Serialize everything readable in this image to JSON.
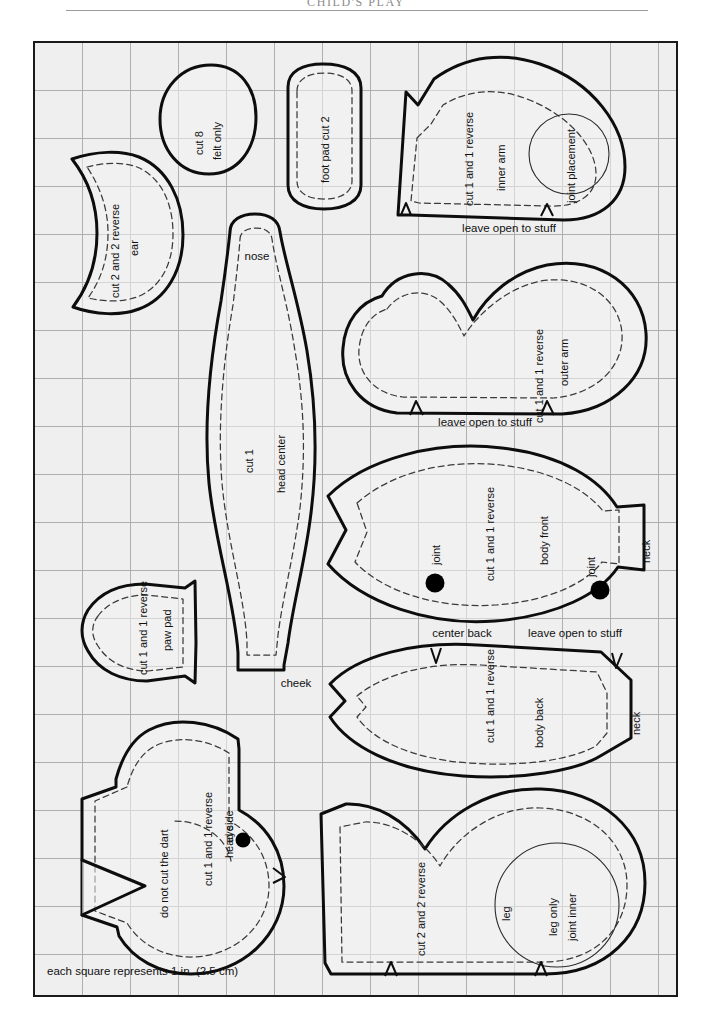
{
  "page": {
    "running_head": "CHILD'S PLAY",
    "scale_caption": "each square represents 1 in. (2.5 cm)"
  },
  "grid": {
    "cell_size_px": 48,
    "columns": 13,
    "rows": 20,
    "square_means": "1 in. (2.5 cm)",
    "sheet_fill": "#efefef",
    "line_color": "#9a9a9a",
    "border_color": "#1a1a1a"
  },
  "legend": {
    "cut_line_color": "#0d0d0d",
    "seam_line_color": "#3a3a3a",
    "marker_color": "#000000"
  },
  "pieces": [
    {
      "id": "felt-circle",
      "name": "felt circle",
      "labels": [
        "cut 8",
        "felt only"
      ],
      "has_seam_allowance": false
    },
    {
      "id": "foot-pad",
      "name": "foot pad",
      "labels": [
        "foot pad cut 2"
      ],
      "has_seam_allowance": true
    },
    {
      "id": "ear",
      "name": "ear",
      "labels": [
        "cut 2 and 2 reverse",
        "ear"
      ],
      "has_seam_allowance": true
    },
    {
      "id": "inner-arm",
      "name": "inner arm",
      "labels": [
        "cut 1 and 1 reverse",
        "inner arm",
        "joint placement"
      ],
      "notes": [
        "leave open to stuff"
      ],
      "has_seam_allowance": true,
      "has_joint_circle": true
    },
    {
      "id": "outer-arm",
      "name": "outer arm",
      "labels": [
        "cut 1 and 1 reverse",
        "outer arm"
      ],
      "notes": [
        "leave open to stuff"
      ],
      "has_seam_allowance": true
    },
    {
      "id": "head-center",
      "name": "head center",
      "labels": [
        "cut 1",
        "head center"
      ],
      "notes": [
        "nose",
        "cheek"
      ],
      "has_seam_allowance": true
    },
    {
      "id": "body-front",
      "name": "body front",
      "labels": [
        "cut 1 and 1 reverse",
        "body front",
        "neck",
        "joint",
        "joint"
      ],
      "has_seam_allowance": true,
      "joint_marks": 2
    },
    {
      "id": "paw-pad",
      "name": "paw pad",
      "labels": [
        "cut 1 and 1 reverse",
        "paw pad"
      ],
      "has_seam_allowance": true
    },
    {
      "id": "body-back",
      "name": "body back",
      "labels": [
        "cut 1 and 1 reverse",
        "body back",
        "neck"
      ],
      "notes": [
        "center back",
        "leave open to stuff"
      ],
      "has_seam_allowance": true
    },
    {
      "id": "head-side",
      "name": "head side",
      "labels": [
        "do not cut the dart",
        "cut 1 and 1 reverse",
        "head side",
        "eye"
      ],
      "has_seam_allowance": true,
      "has_dart": true,
      "joint_marks": 1
    },
    {
      "id": "leg",
      "name": "leg",
      "labels": [
        "cut 2 and 2 reverse",
        "leg",
        "leg only",
        "joint inner"
      ],
      "has_seam_allowance": true,
      "has_joint_circle": true
    }
  ],
  "text": {
    "cut8": "cut 8",
    "felt_only": "felt only",
    "foot_pad_cut2": "foot pad cut 2",
    "cut2_and_2_reverse": "cut 2 and 2 reverse",
    "ear": "ear",
    "cut1_and_1_reverse": "cut 1 and 1 reverse",
    "inner_arm": "inner arm",
    "joint_placement": "joint placement",
    "leave_open_to_stuff": "leave open to stuff",
    "outer_arm": "outer arm",
    "nose": "nose",
    "cut1": "cut 1",
    "head_center": "head center",
    "cheek": "cheek",
    "body_front": "body front",
    "neck": "neck",
    "joint": "joint",
    "paw_pad": "paw pad",
    "center_back": "center back",
    "body_back": "body back",
    "do_not_cut_the_dart": "do not cut the dart",
    "head_side": "head side",
    "eye": "eye",
    "leg": "leg",
    "leg_only": "leg only",
    "joint_inner": "joint inner"
  }
}
